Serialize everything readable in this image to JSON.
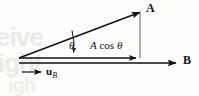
{
  "figure": {
    "background_color": "#fdfdfc",
    "ink_color": "#111111",
    "watermark_color": "#eceae6",
    "watermark": {
      "line1": "eive",
      "line2": "ight",
      "line3": "igh"
    },
    "labels": {
      "vector_a": "A",
      "vector_b": "B",
      "angle": "θ",
      "projection_italic": "A",
      "projection_function": "cos",
      "projection_angle": "θ",
      "unit_vector_symbol": "u",
      "unit_vector_subscript": "B"
    },
    "geometry": {
      "origin_x": 19,
      "origin_y": 58,
      "a_tip_x": 142,
      "a_tip_y": 11,
      "b_line_y": 63,
      "b_tip_x": 178,
      "proj_line_y": 58,
      "proj_tip_x": 138,
      "drop_line_x": 140,
      "unit_arrow_start_x": 22,
      "unit_arrow_end_x": 43,
      "unit_arrow_y": 72,
      "angle_degrees": 21
    }
  }
}
